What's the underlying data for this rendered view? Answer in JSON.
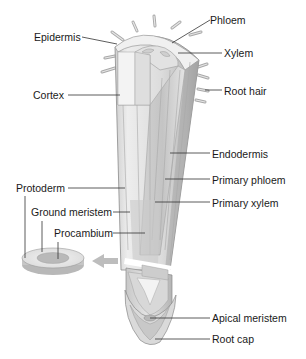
{
  "diagram": {
    "colors": {
      "background": "#ffffff",
      "tissue_light": "#ececec",
      "tissue_mid": "#d6d6d6",
      "tissue_dark": "#b0b0b0",
      "outline": "#8a8a8a",
      "leader_line": "#333333",
      "arrow": "#bdbdbd",
      "label_text": "#1a1a1a"
    },
    "labels": {
      "phloem": "Phloem",
      "xylem": "Xylem",
      "epidermis": "Epidermis",
      "cortex": "Cortex",
      "root_hair": "Root hair",
      "endodermis": "Endodermis",
      "primary_phloem": "Primary phloem",
      "primary_xylem": "Primary xylem",
      "protoderm": "Protoderm",
      "ground_meristem": "Ground meristem",
      "procambium": "Procambium",
      "apical_meristem": "Apical meristem",
      "root_cap": "Root cap"
    }
  }
}
